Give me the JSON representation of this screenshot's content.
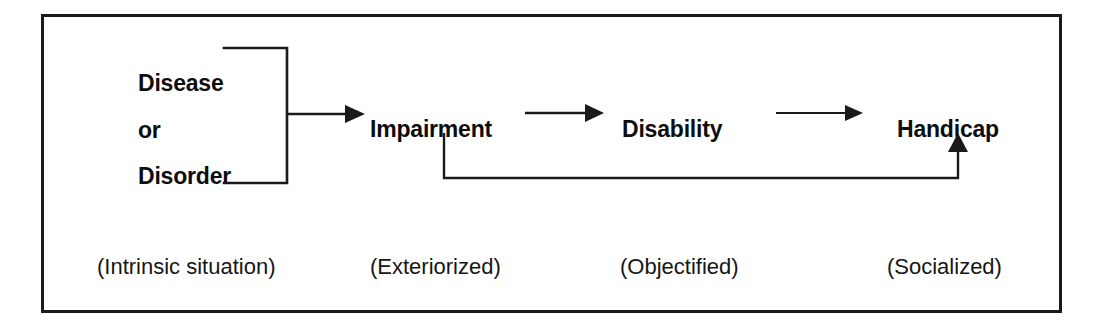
{
  "figure": {
    "frame_color": "#1a1a1a",
    "text_color": "#0d0d0d",
    "background": "#ffffff"
  },
  "source": {
    "name": "disease-or-disorder",
    "lines": [
      "Disease",
      "or",
      "Disorder"
    ],
    "bracket": "square-bracket-right"
  },
  "stages": [
    {
      "id": "impairment",
      "label": "Impairment"
    },
    {
      "id": "disability",
      "label": "Disability"
    },
    {
      "id": "handicap",
      "label": "Handicap"
    }
  ],
  "qualifiers": [
    {
      "id": "intrinsic",
      "label": "(Intrinsic situation)",
      "left": 94
    },
    {
      "id": "exteriorized",
      "label": "(Exteriorized)",
      "left": 367
    },
    {
      "id": "objectified",
      "label": "(Objectified)",
      "left": 617
    },
    {
      "id": "socialized",
      "label": "(Socialized)",
      "left": 884
    }
  ],
  "connectors": [
    {
      "id": "source-to-impairment",
      "type": "arrow-right",
      "from": "disease-or-disorder",
      "to": "impairment"
    },
    {
      "id": "impairment-to-disability",
      "type": "arrow-right",
      "from": "impairment",
      "to": "disability"
    },
    {
      "id": "disability-to-handicap",
      "type": "arrow-right",
      "from": "disability",
      "to": "handicap"
    },
    {
      "id": "impairment-to-handicap-bypass",
      "type": "elbow-arrow-up",
      "from": "impairment",
      "to": "handicap"
    }
  ]
}
